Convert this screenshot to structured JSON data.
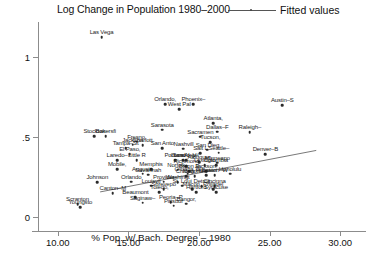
{
  "header": {
    "title": "Log Change in Population 1980–2000",
    "legend_label": "Fitted values",
    "legend_icon": "line-with-dot-icon"
  },
  "axes": {
    "x": {
      "label": "% Pop. w/ Bach. Degree – 1980",
      "ticks": [
        "10.00",
        "15.00",
        "20.00",
        "25.00",
        "30.00"
      ],
      "tick_values": [
        10,
        15,
        20,
        25,
        30
      ],
      "min": 8.6,
      "max": 31.4
    },
    "y": {
      "label": "",
      "ticks": [
        "0",
        ".5",
        "1"
      ],
      "tick_values": [
        0,
        0.5,
        1
      ],
      "min": -0.09,
      "max": 1.22
    }
  },
  "chart_data": {
    "type": "scatter",
    "title": "Log Change in Population 1980–2000",
    "xlabel": "% Pop. w/ Bach. Degree – 1980",
    "ylabel": "Log Change in Population 1980–2000",
    "xlim": [
      8.6,
      31.4
    ],
    "ylim": [
      -0.09,
      1.22
    ],
    "grid": false,
    "legend_position": "top-right",
    "legend": [
      "Fitted values"
    ],
    "fit_line": {
      "name": "Fitted values",
      "x": [
        13.0,
        28.3
      ],
      "y": [
        0.155,
        0.415
      ]
    },
    "points": [
      {
        "label": "Las Vega",
        "x": 13.1,
        "y": 1.125
      },
      {
        "label": "Orlando,",
        "x": 17.6,
        "y": 0.705
      },
      {
        "label": "West Pal",
        "x": 18.6,
        "y": 0.672
      },
      {
        "label": "Phoenix–",
        "x": 19.6,
        "y": 0.705
      },
      {
        "label": "Austin–S",
        "x": 25.9,
        "y": 0.7
      },
      {
        "label": "Atlanta,",
        "x": 21.0,
        "y": 0.585
      },
      {
        "label": "Sarasota",
        "x": 17.4,
        "y": 0.545
      },
      {
        "label": "Dallas–F",
        "x": 21.3,
        "y": 0.533
      },
      {
        "label": "Raleigh–",
        "x": 23.6,
        "y": 0.53
      },
      {
        "label": "Sacramen",
        "x": 20.1,
        "y": 0.5
      },
      {
        "label": "Stockton",
        "x": 12.6,
        "y": 0.505
      },
      {
        "label": "Bakersfi",
        "x": 13.4,
        "y": 0.505
      },
      {
        "label": "Fresno,",
        "x": 15.6,
        "y": 0.47
      },
      {
        "label": "Jackson",
        "x": 15.3,
        "y": 0.452
      },
      {
        "label": "Charlott",
        "x": 16.0,
        "y": 0.447
      },
      {
        "label": "Tucson,",
        "x": 20.8,
        "y": 0.465
      },
      {
        "label": "Tampa–St",
        "x": 14.8,
        "y": 0.428
      },
      {
        "label": "San Anto",
        "x": 17.4,
        "y": 0.428
      },
      {
        "label": "Nashvill",
        "x": 18.9,
        "y": 0.425
      },
      {
        "label": "San Dieg",
        "x": 20.6,
        "y": 0.42
      },
      {
        "label": "Salt L",
        "x": 20.1,
        "y": 0.398
      },
      {
        "label": "Seattle–",
        "x": 21.4,
        "y": 0.4
      },
      {
        "label": "El Paso,",
        "x": 15.1,
        "y": 0.39
      },
      {
        "label": "Denver–B",
        "x": 24.7,
        "y": 0.392
      },
      {
        "label": "Portland",
        "x": 18.3,
        "y": 0.355
      },
      {
        "label": "Oxnard–V",
        "x": 18.9,
        "y": 0.352
      },
      {
        "label": "Albuquer",
        "x": 20.0,
        "y": 0.342
      },
      {
        "label": "Minneapo",
        "x": 21.3,
        "y": 0.337
      },
      {
        "label": "Los Angel",
        "x": 19.1,
        "y": 0.352
      },
      {
        "label": "Laredo–",
        "x": 14.2,
        "y": 0.353
      },
      {
        "label": "Little R",
        "x": 15.6,
        "y": 0.355
      },
      {
        "label": "Columbia",
        "x": 21.2,
        "y": 0.322
      },
      {
        "label": "Richmond",
        "x": 19.1,
        "y": 0.318
      },
      {
        "label": "Lexingto",
        "x": 20.4,
        "y": 0.322
      },
      {
        "label": "Mobile,",
        "x": 14.2,
        "y": 0.298
      },
      {
        "label": "Memphis",
        "x": 16.6,
        "y": 0.298
      },
      {
        "label": "Norfolk–",
        "x": 18.5,
        "y": 0.295
      },
      {
        "label": "Baton R",
        "x": 19.3,
        "y": 0.285
      },
      {
        "label": "Jackson,",
        "x": 20.5,
        "y": 0.285
      },
      {
        "label": "Honolulu",
        "x": 22.2,
        "y": 0.27
      },
      {
        "label": "Houston",
        "x": 20.5,
        "y": 0.258
      },
      {
        "label": "Boston–W",
        "x": 21.1,
        "y": 0.258
      },
      {
        "label": "New York",
        "x": 19.7,
        "y": 0.252
      },
      {
        "label": "Chicago",
        "x": 19.1,
        "y": 0.255
      },
      {
        "label": "Omaha, N",
        "x": 19.2,
        "y": 0.268
      },
      {
        "label": "Augusta",
        "x": 16.0,
        "y": 0.27
      },
      {
        "label": "Savannah",
        "x": 16.4,
        "y": 0.262
      },
      {
        "label": "Johnson",
        "x": 12.8,
        "y": 0.215
      },
      {
        "label": "Orlando",
        "x": 15.2,
        "y": 0.218
      },
      {
        "label": "Provider",
        "x": 17.5,
        "y": 0.218
      },
      {
        "label": "Washingt",
        "x": 18.5,
        "y": 0.215
      },
      {
        "label": "Louisvil",
        "x": 16.6,
        "y": 0.195
      },
      {
        "label": "St. Loui",
        "x": 18.8,
        "y": 0.195
      },
      {
        "label": "Detroit",
        "x": 20.2,
        "y": 0.192
      },
      {
        "label": "Cincinna",
        "x": 21.1,
        "y": 0.192
      },
      {
        "label": "Shrevepo",
        "x": 17.5,
        "y": 0.172
      },
      {
        "label": "Macon,",
        "x": 19.5,
        "y": 0.172
      },
      {
        "label": "Philadel",
        "x": 21.0,
        "y": 0.172
      },
      {
        "label": "Toledo,",
        "x": 17.2,
        "y": 0.152
      },
      {
        "label": "Hartford",
        "x": 19.8,
        "y": 0.152
      },
      {
        "label": "Syracuse",
        "x": 21.2,
        "y": 0.152
      },
      {
        "label": "Canton–M",
        "x": 13.9,
        "y": 0.148
      },
      {
        "label": "Beaumont",
        "x": 15.5,
        "y": 0.122
      },
      {
        "label": "Saginaw–",
        "x": 16.0,
        "y": 0.088
      },
      {
        "label": "Peoria–P",
        "x": 18.0,
        "y": 0.09
      },
      {
        "label": "Pittsbur",
        "x": 18.2,
        "y": 0.068
      },
      {
        "label": "Bangor,",
        "x": 19.1,
        "y": 0.08
      },
      {
        "label": "Scranton",
        "x": 11.4,
        "y": 0.078
      },
      {
        "label": "Youngsto",
        "x": 11.6,
        "y": 0.058
      }
    ]
  }
}
